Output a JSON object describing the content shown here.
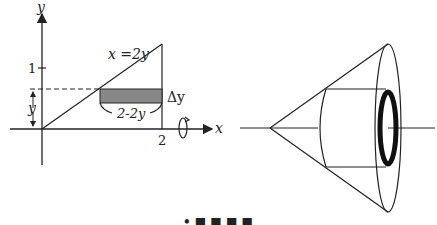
{
  "left_figure": {
    "axis_x_label": "x",
    "axis_y_label": "y",
    "tick_y_1": "1",
    "tick_x_2": "2",
    "curve_label": "x =2y",
    "height_label": "y",
    "thickness_label": "Δy",
    "width_label": "2-2y",
    "rotation_icon": "rotation-arrow-about-x-axis"
  },
  "right_figure": {
    "description": "cone of revolution with inner cylinder cut out, showing thin washer ring"
  },
  "caption": {
    "text": "• ■ ■ ■ ■"
  },
  "colors": {
    "stroke": "#222222",
    "shade": "#888888",
    "ring": "#111111"
  }
}
